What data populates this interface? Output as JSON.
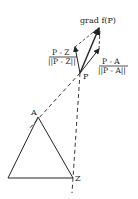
{
  "diagram": {
    "labels": {
      "grad": "grad f(P)",
      "pz_num": "P - Z",
      "pz_den": "||P - Z||",
      "pa_num": "P - A",
      "pa_den": "||P - A||",
      "point_p": "P",
      "point_a": "A",
      "point_z": "Z"
    },
    "points": {
      "P": [
        80,
        73
      ],
      "A": [
        38,
        117
      ],
      "Z": [
        73,
        178
      ],
      "B": [
        8,
        178
      ]
    },
    "colors": {
      "ink": "#222222",
      "background": "#ffffff"
    }
  }
}
